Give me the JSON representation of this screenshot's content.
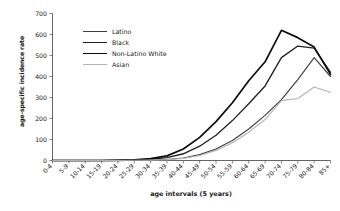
{
  "chart_data": {
    "type": "line",
    "title": "",
    "xlabel": "age intervals (5 years)",
    "ylabel": "age-specific incidence rate",
    "categories": [
      "0-4",
      "5-9",
      "10-14",
      "15-19",
      "20-24",
      "25-29",
      "30-34",
      "35-39",
      "40-44",
      "45-49",
      "50-54",
      "55-59",
      "60-64",
      "65-69",
      "70-74",
      "75-79",
      "80-84",
      "85+"
    ],
    "ylim": [
      0,
      700
    ],
    "yticks": [
      0,
      100,
      200,
      300,
      400,
      500,
      600,
      700
    ],
    "grid": false,
    "legend_position": "upper-left-inside",
    "series": [
      {
        "name": "Latino",
        "color": "#3f3f3f",
        "width": 1.15,
        "values": [
          0,
          0,
          0,
          0,
          0,
          1,
          2,
          5,
          12,
          28,
          55,
          95,
          150,
          215,
          290,
          385,
          490,
          400
        ]
      },
      {
        "name": "Black",
        "color": "#232323",
        "width": 1.35,
        "values": [
          0,
          0,
          0,
          0,
          1,
          2,
          6,
          14,
          32,
          68,
          120,
          190,
          270,
          355,
          490,
          545,
          535,
          420
        ]
      },
      {
        "name": "Non-Latino White",
        "color": "#0d0d0d",
        "width": 1.7,
        "values": [
          0,
          0,
          0,
          0,
          1,
          3,
          9,
          22,
          55,
          110,
          185,
          275,
          380,
          470,
          620,
          585,
          540,
          410
        ]
      },
      {
        "name": "Asian",
        "color": "#b3b3b3",
        "width": 1.15,
        "values": [
          0,
          0,
          0,
          0,
          0,
          1,
          2,
          4,
          10,
          24,
          48,
          85,
          135,
          195,
          285,
          295,
          350,
          325
        ]
      }
    ]
  }
}
